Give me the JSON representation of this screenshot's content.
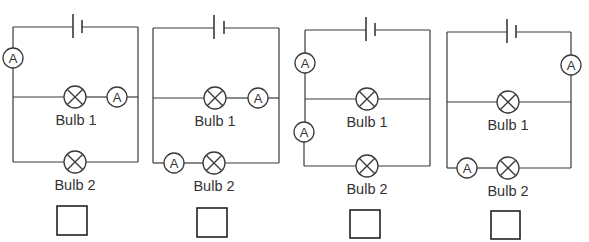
{
  "diagram": {
    "type": "circuit-diagrams",
    "colors": {
      "line": "#3a3a3a",
      "text": "#333333",
      "background": "#ffffff"
    },
    "circuits": [
      {
        "id": 1,
        "frame": {
          "left": 13,
          "right": 138,
          "top": 27,
          "mid": 97,
          "bottom": 162
        },
        "battery": {
          "long_x": 73,
          "short_x": 82
        },
        "bulbs": [
          {
            "label": "Bulb 1",
            "x": 75,
            "y": 97
          },
          {
            "label": "Bulb 2",
            "x": 75,
            "y": 162
          }
        ],
        "ammeters": [
          {
            "symbol": "A",
            "x": 13,
            "y": 58,
            "position": "left-top"
          },
          {
            "symbol": "A",
            "x": 117,
            "y": 97,
            "position": "bulb1-branch"
          }
        ],
        "answer_box": {
          "x": 57,
          "y": 206,
          "checked": false
        }
      },
      {
        "id": 2,
        "frame": {
          "left": 153,
          "right": 279,
          "top": 28,
          "mid": 98,
          "bottom": 163
        },
        "battery": {
          "long_x": 214,
          "short_x": 224
        },
        "bulbs": [
          {
            "label": "Bulb 1",
            "x": 215,
            "y": 98
          },
          {
            "label": "Bulb 2",
            "x": 214,
            "y": 163
          }
        ],
        "ammeters": [
          {
            "symbol": "A",
            "x": 258,
            "y": 98,
            "position": "bulb1-branch"
          },
          {
            "symbol": "A",
            "x": 174,
            "y": 163,
            "position": "bulb2-branch"
          }
        ],
        "answer_box": {
          "x": 197,
          "y": 208,
          "checked": false
        }
      },
      {
        "id": 3,
        "frame": {
          "left": 305,
          "right": 430,
          "top": 30,
          "mid": 99,
          "bottom": 166
        },
        "battery": {
          "long_x": 366,
          "short_x": 375
        },
        "bulbs": [
          {
            "label": "Bulb 1",
            "x": 367,
            "y": 99
          },
          {
            "label": "Bulb 2",
            "x": 367,
            "y": 166
          }
        ],
        "ammeters": [
          {
            "symbol": "A",
            "x": 305,
            "y": 63,
            "position": "left-top"
          },
          {
            "symbol": "A",
            "x": 304,
            "y": 132,
            "position": "left-bottom"
          }
        ],
        "answer_box": {
          "x": 350,
          "y": 210,
          "checked": false
        }
      },
      {
        "id": 4,
        "frame": {
          "left": 447,
          "right": 571,
          "top": 32,
          "mid": 102,
          "bottom": 168
        },
        "battery": {
          "long_x": 507,
          "short_x": 516
        },
        "bulbs": [
          {
            "label": "Bulb 1",
            "x": 508,
            "y": 102
          },
          {
            "label": "Bulb 2",
            "x": 508,
            "y": 168
          }
        ],
        "ammeters": [
          {
            "symbol": "A",
            "x": 571,
            "y": 65,
            "position": "right-top"
          },
          {
            "symbol": "A",
            "x": 467,
            "y": 168,
            "position": "bulb2-branch"
          }
        ],
        "answer_box": {
          "x": 491,
          "y": 211,
          "checked": false
        }
      }
    ]
  },
  "labels": {
    "c1": {
      "bulb1": "Bulb 1",
      "bulb2": "Bulb 2",
      "amm1": "A",
      "amm2": "A"
    },
    "c2": {
      "bulb1": "Bulb 1",
      "bulb2": "Bulb 2",
      "amm1": "A",
      "amm2": "A"
    },
    "c3": {
      "bulb1": "Bulb 1",
      "bulb2": "Bulb 2",
      "amm1": "A",
      "amm2": "A"
    },
    "c4": {
      "bulb1": "Bulb 1",
      "bulb2": "Bulb 2",
      "amm1": "A",
      "amm2": "A"
    }
  }
}
